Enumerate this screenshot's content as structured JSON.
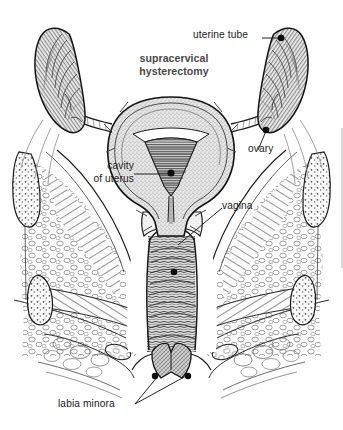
{
  "figure": {
    "title": "supracervical\nhysterectomy",
    "title_color": "#4a4a4a",
    "background_color": "#ffffff",
    "ink_color": "#1a1a1a",
    "label_color": "#222222",
    "width": 343,
    "height": 430
  },
  "labels": {
    "uterine_tube": "uterine tube",
    "ovary": "ovary",
    "cavity_of_uterus_line1": "cavity",
    "cavity_of_uterus_line2": "of uterus",
    "vagina": "vagina",
    "labia_minora": "labia minora"
  },
  "structures": [
    {
      "name": "uterine tube",
      "side": "right",
      "marker": true
    },
    {
      "name": "ovary",
      "side": "right",
      "marker": true
    },
    {
      "name": "cavity of uterus",
      "side": "center",
      "marker": true
    },
    {
      "name": "vagina",
      "side": "center",
      "marker": true
    },
    {
      "name": "labia minora",
      "side": "both",
      "marker": true
    },
    {
      "name": "uterus body",
      "side": "center",
      "marker": false
    },
    {
      "name": "pelvic bone",
      "side": "both",
      "marker": false
    },
    {
      "name": "pelvic soft tissue",
      "side": "both",
      "marker": false
    }
  ]
}
